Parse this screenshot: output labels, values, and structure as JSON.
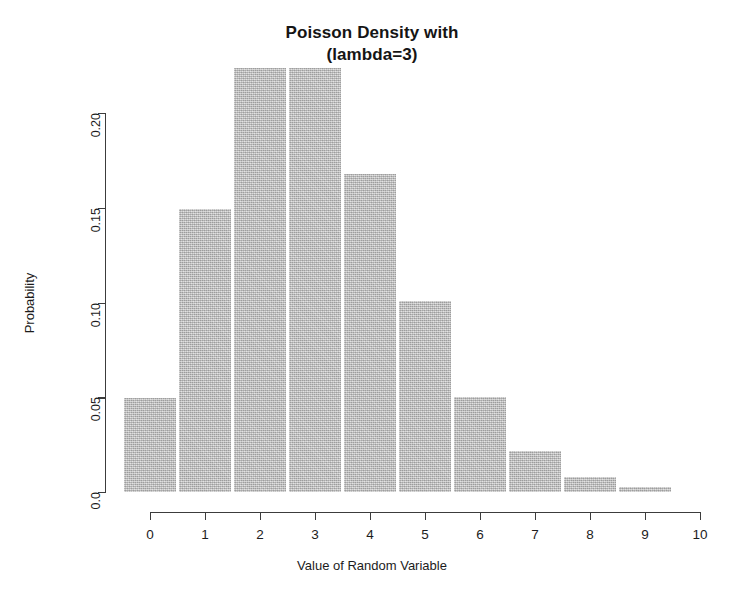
{
  "chart_data": {
    "type": "bar",
    "title": "Poisson Density with\n(lambda=3)",
    "title_lines": [
      "Poisson Density with",
      "(lambda=3)"
    ],
    "xlabel": "Value of Random Variable",
    "ylabel": "Probability",
    "categories": [
      "0",
      "1",
      "2",
      "3",
      "4",
      "5",
      "6",
      "7",
      "8",
      "9"
    ],
    "values": [
      0.0498,
      0.1494,
      0.224,
      0.224,
      0.168,
      0.1008,
      0.0504,
      0.0216,
      0.0081,
      0.0027
    ],
    "x": [
      0,
      1,
      2,
      3,
      4,
      5,
      6,
      7,
      8,
      9
    ],
    "xlim": [
      0,
      10
    ],
    "ylim": [
      0.0,
      0.2
    ],
    "xticks": [
      "0",
      "1",
      "2",
      "3",
      "4",
      "5",
      "6",
      "7",
      "8",
      "9",
      "10"
    ],
    "xtick_values": [
      0,
      1,
      2,
      3,
      4,
      5,
      6,
      7,
      8,
      9,
      10
    ],
    "yticks": [
      "0.0",
      "0.05",
      "0.10",
      "0.15",
      "0.20"
    ],
    "ytick_values": [
      0.0,
      0.05,
      0.1,
      0.15,
      0.2
    ],
    "grid": false,
    "legend": null,
    "bar_color": "#b6b6b6",
    "axis_color": "#3c3c3c",
    "background_color": "#ffffff"
  }
}
